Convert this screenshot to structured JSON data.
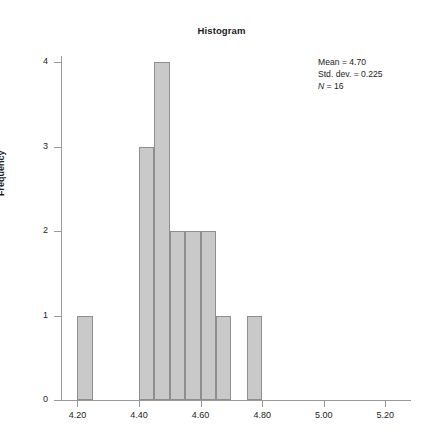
{
  "chart_data": {
    "type": "bar",
    "title": "Histogram",
    "xlabel": "",
    "ylabel": "Frequency",
    "xlim": [
      4.15,
      5.28
    ],
    "ylim": [
      0,
      4
    ],
    "grid": false,
    "legend_position": "none",
    "bin_width": 0.05,
    "x_tick_labels": [
      "4.20",
      "4.40",
      "4.60",
      "4.80",
      "5.00",
      "5.20"
    ],
    "x_tick_values": [
      4.2,
      4.4,
      4.6,
      4.8,
      5.0,
      5.2
    ],
    "y_tick_labels": [
      "0",
      "1",
      "2",
      "3",
      "4"
    ],
    "y_tick_values": [
      0,
      1,
      2,
      3,
      4
    ],
    "categories": [
      "4.20-4.25",
      "4.45-4.50",
      "4.50-4.55",
      "4.55-4.60",
      "4.60-4.65",
      "4.65-4.70",
      "4.70-4.75",
      "4.75-4.80",
      "4.95-5.00"
    ],
    "values": [
      1,
      3,
      4,
      2,
      2,
      2,
      1,
      1,
      1
    ],
    "bins": [
      {
        "start": 4.2,
        "end": 4.25,
        "count": 1
      },
      {
        "start": 4.4,
        "end": 4.45,
        "count": 3
      },
      {
        "start": 4.45,
        "end": 4.5,
        "count": 4
      },
      {
        "start": 4.5,
        "end": 4.55,
        "count": 2
      },
      {
        "start": 4.55,
        "end": 4.6,
        "count": 2
      },
      {
        "start": 4.6,
        "end": 4.65,
        "count": 2
      },
      {
        "start": 4.65,
        "end": 4.7,
        "count": 1
      },
      {
        "start": 4.75,
        "end": 4.8,
        "count": 1
      }
    ],
    "bar_color": "#c9c9c9",
    "bar_edge_color": "#8e8e8e",
    "axis_color": "#9a9a9a",
    "text_color": "#1c1c1c"
  },
  "annotation": {
    "mean_label": "Mean = 4.70",
    "stddev_label": "Std. dev. = 0.225",
    "n_symbol": "N",
    "n_value": " = 16"
  }
}
